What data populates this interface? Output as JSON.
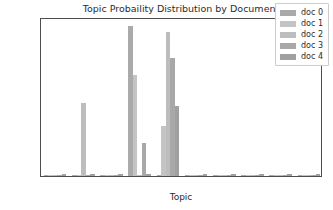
{
  "chart_data": {
    "type": "bar",
    "title": "Topic Probaility Distribution by Document",
    "xlabel": "Topic",
    "ylabel": "Probability",
    "categories": [
      "1",
      "2",
      "3",
      "4",
      "5",
      "6",
      "7",
      "8",
      "9",
      "10"
    ],
    "xlim": [
      0.5,
      10.5
    ],
    "ylim": [
      0.0,
      1.0
    ],
    "yticks": [
      "0.0",
      "0.2",
      "0.4",
      "0.6",
      "0.8"
    ],
    "ytick_values": [
      0.0,
      0.2,
      0.4,
      0.6,
      0.8
    ],
    "grid": false,
    "legend_position": "upper right",
    "bar_color": "#b2b2b2",
    "series": [
      {
        "name": "doc 0",
        "color": "#aaaaaa",
        "values": [
          0.002,
          0.002,
          0.002,
          0.945,
          0.002,
          0.002,
          0.002,
          0.002,
          0.002,
          0.002
        ]
      },
      {
        "name": "doc 1",
        "color": "#c4c4c4",
        "values": [
          0.002,
          0.002,
          0.002,
          0.637,
          0.315,
          0.002,
          0.002,
          0.002,
          0.002,
          0.002
        ]
      },
      {
        "name": "doc 2",
        "color": "#bdbdbd",
        "values": [
          0.002,
          0.46,
          0.002,
          0.002,
          0.905,
          0.002,
          0.002,
          0.002,
          0.002,
          0.002
        ]
      },
      {
        "name": "doc 3",
        "color": "#a8a8a8",
        "values": [
          0.002,
          0.002,
          0.002,
          0.21,
          0.74,
          0.002,
          0.002,
          0.002,
          0.002,
          0.002
        ]
      },
      {
        "name": "doc 4",
        "color": "#a0a0a0",
        "values": [
          0.01,
          0.01,
          0.01,
          0.012,
          0.44,
          0.01,
          0.01,
          0.01,
          0.01,
          0.01
        ]
      }
    ]
  }
}
